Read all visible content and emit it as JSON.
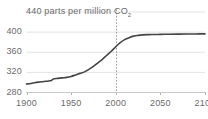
{
  "chart_data": {
    "type": "line",
    "title": "440 parts per million CO",
    "title_subscript": "2",
    "title_full": "440 parts per million CO2",
    "xlabel": "",
    "ylabel": "parts per million CO2",
    "xlim": [
      1900,
      2100
    ],
    "ylim": [
      280,
      440
    ],
    "grid": true,
    "legend": false,
    "series_color": "#444444",
    "grid_color": "#e3e3e3",
    "text_color": "#6b6b6b",
    "yticks": [
      "440",
      "400",
      "360",
      "320",
      "280"
    ],
    "ytick_values": [
      440,
      400,
      360,
      320,
      280
    ],
    "xticks": [
      "1900",
      "1950",
      "2000",
      "2050",
      "2100"
    ],
    "xtick_values": [
      1900,
      1950,
      2000,
      2050,
      2100
    ],
    "annotations": [
      {
        "name": "present-day-marker",
        "type": "vertical-dashed-line",
        "x": 2000,
        "label": ""
      }
    ],
    "series": [
      {
        "name": "CO2 concentration",
        "x": [
          1900,
          1905,
          1910,
          1915,
          1920,
          1925,
          1928,
          1930,
          1935,
          1940,
          1945,
          1950,
          1955,
          1960,
          1965,
          1970,
          1975,
          1980,
          1985,
          1990,
          1995,
          2000,
          2005,
          2010,
          2015,
          2020,
          2025,
          2030,
          2035,
          2040,
          2050,
          2060,
          2070,
          2080,
          2090,
          2100
        ],
        "values": [
          296,
          297,
          299,
          300,
          301,
          302,
          303,
          306,
          307,
          308,
          309,
          311,
          314,
          317,
          320,
          325,
          331,
          338,
          345,
          353,
          361,
          370,
          378,
          384,
          388,
          391,
          392.5,
          393.5,
          394,
          394.2,
          394.5,
          394.8,
          395,
          395.2,
          395.4,
          395.5
        ]
      }
    ]
  },
  "axis_labels": {
    "y": [
      {
        "text": "440",
        "value": 440
      },
      {
        "text": "400",
        "value": 400
      },
      {
        "text": "360",
        "value": 360
      },
      {
        "text": "320",
        "value": 320
      },
      {
        "text": "280",
        "value": 280
      }
    ],
    "x": [
      {
        "text": "1900",
        "value": 1900
      },
      {
        "text": "1950",
        "value": 1950
      },
      {
        "text": "2000",
        "value": 2000
      },
      {
        "text": "2050",
        "value": 2050
      },
      {
        "text": "2100",
        "value": 2100
      }
    ]
  },
  "title_parts": {
    "value": "440",
    "rest": " parts per million CO",
    "subscript": "2"
  }
}
